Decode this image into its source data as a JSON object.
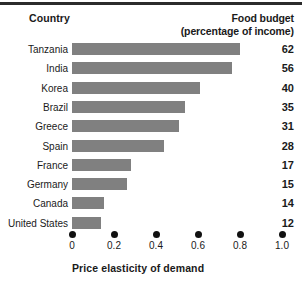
{
  "header": {
    "country_heading": "Country",
    "budget_heading_line1": "Food budget",
    "budget_heading_line2": "(percentage of income)"
  },
  "axis": {
    "x_title": "Price elasticity of demand",
    "ticks": [
      "0",
      "0.2",
      "0.4",
      "0.6",
      "0.8",
      "1.0"
    ]
  },
  "colors": {
    "bar": "#808080",
    "text": "#1a1a1a",
    "rule": "#2b2b2b",
    "background": "#ffffff"
  },
  "chart_data": {
    "type": "bar",
    "orientation": "horizontal",
    "title": "",
    "xlabel": "Price elasticity of demand",
    "ylabel": "Country",
    "xlim": [
      0,
      1.0
    ],
    "xticks": [
      0,
      0.2,
      0.4,
      0.6,
      0.8,
      1.0
    ],
    "grid": false,
    "legend": false,
    "categories": [
      "Tanzania",
      "India",
      "Korea",
      "Brazil",
      "Greece",
      "Spain",
      "France",
      "Germany",
      "Canada",
      "United States"
    ],
    "series": [
      {
        "name": "Price elasticity of demand",
        "values": [
          0.8,
          0.76,
          0.61,
          0.54,
          0.51,
          0.44,
          0.28,
          0.26,
          0.15,
          0.14
        ]
      }
    ],
    "data_labels": {
      "name": "Food budget (percentage of income)",
      "values": [
        62,
        56,
        40,
        35,
        31,
        28,
        17,
        15,
        14,
        12
      ]
    },
    "rows": [
      {
        "country": "Tanzania",
        "elasticity": 0.8,
        "food_budget": 62
      },
      {
        "country": "India",
        "elasticity": 0.76,
        "food_budget": 56
      },
      {
        "country": "Korea",
        "elasticity": 0.61,
        "food_budget": 40
      },
      {
        "country": "Brazil",
        "elasticity": 0.54,
        "food_budget": 35
      },
      {
        "country": "Greece",
        "elasticity": 0.51,
        "food_budget": 31
      },
      {
        "country": "Spain",
        "elasticity": 0.44,
        "food_budget": 28
      },
      {
        "country": "France",
        "elasticity": 0.28,
        "food_budget": 17
      },
      {
        "country": "Germany",
        "elasticity": 0.26,
        "food_budget": 15
      },
      {
        "country": "Canada",
        "elasticity": 0.15,
        "food_budget": 14
      },
      {
        "country": "United States",
        "elasticity": 0.14,
        "food_budget": 12
      }
    ]
  }
}
